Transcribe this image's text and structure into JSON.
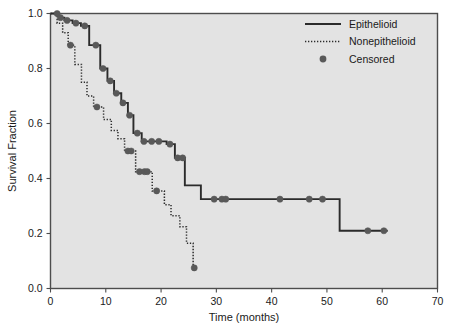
{
  "chart_data": {
    "type": "line",
    "title": "",
    "subtitle": "",
    "xlabel": "Time (months)",
    "ylabel": "Survival Fraction",
    "xlim": [
      0,
      70
    ],
    "ylim": [
      0.0,
      1.0
    ],
    "xticks": [
      0,
      10,
      20,
      30,
      40,
      50,
      60,
      70
    ],
    "xtick_labels": [
      "0",
      "10",
      "20",
      "30",
      "40",
      "50",
      "60",
      "70"
    ],
    "yticks": [
      0.0,
      0.2,
      0.4,
      0.6,
      0.8,
      1.0
    ],
    "ytick_labels": [
      "0.0",
      "0.2",
      "0.4",
      "0.6",
      "0.8",
      "1.0"
    ],
    "grid": false,
    "legend_position": "top-right",
    "plot_background": "#e3e3e3",
    "frame_color": "#4d4d4d",
    "line_color": "#2b2b2b",
    "marker_color": "#595959",
    "step_style": "post",
    "series": [
      {
        "name": "Epithelioid",
        "style": "solid",
        "points": [
          [
            0.0,
            1.0
          ],
          [
            1.0,
            1.0
          ],
          [
            1.5,
            0.985
          ],
          [
            2.0,
            0.985
          ],
          [
            2.5,
            0.975
          ],
          [
            3.5,
            0.975
          ],
          [
            4.0,
            0.965
          ],
          [
            5.0,
            0.965
          ],
          [
            5.5,
            0.955
          ],
          [
            6.5,
            0.955
          ],
          [
            7.0,
            0.885
          ],
          [
            8.5,
            0.885
          ],
          [
            9.0,
            0.8
          ],
          [
            9.8,
            0.8
          ],
          [
            10.3,
            0.755
          ],
          [
            11.0,
            0.755
          ],
          [
            11.5,
            0.71
          ],
          [
            12.3,
            0.71
          ],
          [
            12.8,
            0.675
          ],
          [
            13.4,
            0.675
          ],
          [
            14.0,
            0.63
          ],
          [
            14.5,
            0.63
          ],
          [
            15.0,
            0.565
          ],
          [
            16.0,
            0.565
          ],
          [
            16.5,
            0.535
          ],
          [
            20.5,
            0.535
          ],
          [
            21.0,
            0.525
          ],
          [
            22.0,
            0.525
          ],
          [
            22.5,
            0.475
          ],
          [
            24.0,
            0.475
          ],
          [
            24.3,
            0.375
          ],
          [
            27.0,
            0.375
          ],
          [
            27.2,
            0.325
          ],
          [
            52.0,
            0.325
          ],
          [
            52.3,
            0.21
          ],
          [
            61.0,
            0.21
          ]
        ],
        "censored": [
          [
            1.2,
            1.0
          ],
          [
            1.8,
            0.985
          ],
          [
            3.0,
            0.975
          ],
          [
            4.6,
            0.965
          ],
          [
            6.2,
            0.955
          ],
          [
            8.2,
            0.885
          ],
          [
            9.5,
            0.8
          ],
          [
            10.8,
            0.755
          ],
          [
            11.9,
            0.71
          ],
          [
            13.1,
            0.675
          ],
          [
            14.3,
            0.63
          ],
          [
            15.7,
            0.565
          ],
          [
            16.9,
            0.535
          ],
          [
            18.3,
            0.535
          ],
          [
            19.6,
            0.535
          ],
          [
            21.6,
            0.525
          ],
          [
            23.0,
            0.475
          ],
          [
            23.9,
            0.475
          ],
          [
            29.6,
            0.325
          ],
          [
            31.0,
            0.325
          ],
          [
            31.7,
            0.325
          ],
          [
            41.5,
            0.325
          ],
          [
            46.8,
            0.325
          ],
          [
            49.2,
            0.325
          ],
          [
            57.4,
            0.21
          ],
          [
            60.3,
            0.21
          ]
        ]
      },
      {
        "name": "Nonepithelioid",
        "style": "dotted",
        "points": [
          [
            0.0,
            1.0
          ],
          [
            0.8,
            1.0
          ],
          [
            1.2,
            0.965
          ],
          [
            1.8,
            0.965
          ],
          [
            2.2,
            0.93
          ],
          [
            2.8,
            0.93
          ],
          [
            3.2,
            0.885
          ],
          [
            4.0,
            0.885
          ],
          [
            4.4,
            0.815
          ],
          [
            5.2,
            0.815
          ],
          [
            5.6,
            0.75
          ],
          [
            6.2,
            0.75
          ],
          [
            6.6,
            0.7
          ],
          [
            7.4,
            0.7
          ],
          [
            7.8,
            0.66
          ],
          [
            9.2,
            0.66
          ],
          [
            9.6,
            0.615
          ],
          [
            10.6,
            0.615
          ],
          [
            11.0,
            0.575
          ],
          [
            11.8,
            0.575
          ],
          [
            12.2,
            0.545
          ],
          [
            13.0,
            0.545
          ],
          [
            13.4,
            0.5
          ],
          [
            15.0,
            0.5
          ],
          [
            15.4,
            0.425
          ],
          [
            18.0,
            0.425
          ],
          [
            18.4,
            0.355
          ],
          [
            20.2,
            0.355
          ],
          [
            20.6,
            0.305
          ],
          [
            21.4,
            0.305
          ],
          [
            21.8,
            0.265
          ],
          [
            23.0,
            0.265
          ],
          [
            23.4,
            0.225
          ],
          [
            24.2,
            0.225
          ],
          [
            24.6,
            0.165
          ],
          [
            25.4,
            0.165
          ],
          [
            25.8,
            0.075
          ],
          [
            26.2,
            0.075
          ]
        ],
        "censored": [
          [
            3.6,
            0.885
          ],
          [
            8.4,
            0.66
          ],
          [
            14.0,
            0.5
          ],
          [
            14.6,
            0.5
          ],
          [
            16.1,
            0.425
          ],
          [
            17.0,
            0.425
          ],
          [
            17.5,
            0.425
          ],
          [
            19.2,
            0.355
          ],
          [
            26.0,
            0.075
          ]
        ]
      }
    ],
    "legend": [
      {
        "label": "Epithelioid",
        "symbol": "solid-line"
      },
      {
        "label": "Nonepithelioid",
        "symbol": "dotted-line"
      },
      {
        "label": "Censored",
        "symbol": "filled-circle"
      }
    ]
  }
}
